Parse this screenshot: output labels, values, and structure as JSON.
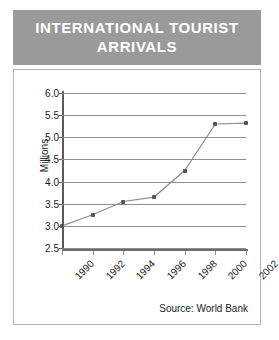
{
  "title": "INTERNATIONAL TOURIST ARRIVALS",
  "title_lines": [
    "INTERNATIONAL TOURIST",
    "ARRIVALS"
  ],
  "source": "Source: World Bank",
  "colors": {
    "banner_bg": "#9a9a9a",
    "banner_text": "#ffffff",
    "panel_bg": "#ffffff",
    "panel_border": "#b4b4b4",
    "gridline": "#8e8e8e",
    "axis": "#5a5a5a",
    "series_line": "#8c8c8c",
    "marker": "#555555",
    "tick_text": "#1c1c1c"
  },
  "chart_data": {
    "type": "line",
    "title": "INTERNATIONAL TOURIST ARRIVALS",
    "xlabel": "",
    "ylabel": "Millions",
    "x": [
      1990,
      1992,
      1994,
      1996,
      1998,
      2000,
      2002
    ],
    "values": [
      3.0,
      3.25,
      3.55,
      3.65,
      4.25,
      5.3,
      5.32
    ],
    "categories": [
      "1990",
      "1992",
      "1994",
      "1996",
      "1998",
      "2000",
      "2002"
    ],
    "xtick_labels": [
      "1990",
      "1992",
      "1994",
      "1996",
      "1998",
      "2000",
      "2002"
    ],
    "ytick_labels": [
      "6.0",
      "5.5",
      "5.0",
      "4.5",
      "4.0",
      "3.5",
      "3.0",
      "2.5"
    ],
    "ytick_values": [
      6.0,
      5.5,
      5.0,
      4.5,
      4.0,
      3.5,
      3.0,
      2.5
    ],
    "ylim": [
      2.5,
      6.0
    ],
    "xlim": [
      1990,
      2002
    ],
    "grid": true,
    "legend": false,
    "marker": "square",
    "series": [
      {
        "name": "International tourist arrivals",
        "values": [
          3.0,
          3.25,
          3.55,
          3.65,
          4.25,
          5.3,
          5.32
        ]
      }
    ],
    "annotations": [
      "Source: World Bank"
    ]
  }
}
